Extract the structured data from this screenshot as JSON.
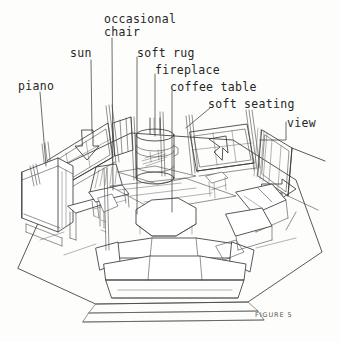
{
  "figure": {
    "caption": "FIGURE 5",
    "background_color": "#fdfdfc",
    "ink_color": "#3a3a3a",
    "text_color": "#262626"
  },
  "labels": [
    {
      "id": "piano",
      "text": "piano",
      "x": 18,
      "y": 80,
      "lines": 1
    },
    {
      "id": "sun",
      "text": "sun",
      "x": 70,
      "y": 47,
      "lines": 1
    },
    {
      "id": "occasional",
      "text": "occasional",
      "x": 104,
      "y": 13,
      "lines": 1
    },
    {
      "id": "chair",
      "text": "chair",
      "x": 104,
      "y": 26,
      "lines": 1
    },
    {
      "id": "soft-rug",
      "text": "soft rug",
      "x": 137,
      "y": 47,
      "lines": 1
    },
    {
      "id": "fireplace",
      "text": "fireplace",
      "x": 155,
      "y": 64,
      "lines": 1
    },
    {
      "id": "coffee-table",
      "text": "coffee table",
      "x": 170,
      "y": 81,
      "lines": 1
    },
    {
      "id": "soft-seating",
      "text": "soft seating",
      "x": 208,
      "y": 98,
      "lines": 1
    },
    {
      "id": "view",
      "text": "view",
      "x": 287,
      "y": 117,
      "lines": 1
    }
  ],
  "scene": {
    "room_type": "living room",
    "view": "aerial cutaway perspective",
    "furniture": [
      "upright piano",
      "piano bench",
      "occasional chair",
      "cylindrical wood stove fireplace",
      "octagonal coffee table",
      "soft rug",
      "sectional soft seating with cushions",
      "side table"
    ],
    "arrows": [
      {
        "name": "sun-arrow-left",
        "direction": "down-right",
        "meaning": "sunlight entering"
      },
      {
        "name": "sun-arrow-right",
        "direction": "up-right",
        "meaning": "sunlight entering"
      },
      {
        "name": "view-arrow",
        "direction": "right",
        "meaning": "view direction"
      }
    ],
    "windows": 3
  }
}
